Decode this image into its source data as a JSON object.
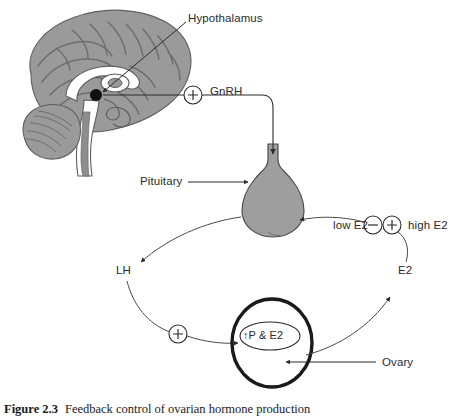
{
  "figure": {
    "number": "Figure 2.3",
    "caption": "Feedback control of ovarian hormone production"
  },
  "diagram": {
    "labels": {
      "hypothalamus": "Hypothalamus",
      "gnrh": "GnRH",
      "pituitary": "Pituitary",
      "lh": "LH",
      "e2": "E2",
      "low_e2": "low E2",
      "high_e2": "high E2",
      "ovary": "Ovary",
      "ovary_contents": "↑P & E2"
    },
    "signs": {
      "gnrh_sign": "+",
      "lh_sign": "+",
      "low_e2_sign": "−",
      "high_e2_sign": "+"
    },
    "colors": {
      "brain_fill": "#9a9a9a",
      "brain_dark": "#7d7d7d",
      "brain_light": "#ffffff",
      "pituitary_fill": "#9e9e9e",
      "stroke": "#2b2b2b",
      "background": "#ffffff"
    }
  }
}
